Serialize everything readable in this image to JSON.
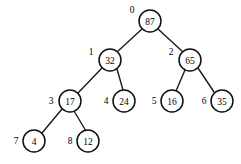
{
  "figure": {
    "type": "binary-tree-diagram",
    "title": "",
    "background_color": "#ffffff",
    "node_fill": "#ffffff",
    "node_stroke": "#111111",
    "edge_color": "#1a1a1a",
    "label_color": "#000000"
  },
  "tree": {
    "node_radius": 11,
    "nodes": [
      {
        "index": "0",
        "value": "87",
        "cx": 150,
        "cy": 21,
        "index_x": 132,
        "index_y": 10
      },
      {
        "index": "1",
        "value": "32",
        "cx": 110,
        "cy": 60,
        "index_x": 91,
        "index_y": 52
      },
      {
        "index": "2",
        "value": "65",
        "cx": 190,
        "cy": 60,
        "index_x": 171,
        "index_y": 52
      },
      {
        "index": "3",
        "value": "17",
        "cx": 70,
        "cy": 101,
        "index_x": 51,
        "index_y": 101
      },
      {
        "index": "4",
        "value": "24",
        "cx": 124,
        "cy": 101,
        "index_x": 106,
        "index_y": 101
      },
      {
        "index": "5",
        "value": "16",
        "cx": 172,
        "cy": 101,
        "index_x": 154,
        "index_y": 101
      },
      {
        "index": "6",
        "value": "35",
        "cx": 222,
        "cy": 101,
        "index_x": 204,
        "index_y": 101
      },
      {
        "index": "7",
        "value": "4",
        "cx": 34,
        "cy": 141,
        "index_x": 16,
        "index_y": 141
      },
      {
        "index": "8",
        "value": "12",
        "cx": 88,
        "cy": 141,
        "index_x": 70,
        "index_y": 141
      }
    ],
    "edges": [
      {
        "from": "0",
        "to": "1",
        "x1": 142,
        "y1": 29,
        "x2": 117,
        "y2": 52
      },
      {
        "from": "0",
        "to": "2",
        "x1": 158,
        "y1": 29,
        "x2": 183,
        "y2": 52
      },
      {
        "from": "1",
        "to": "3",
        "x1": 102,
        "y1": 68,
        "x2": 78,
        "y2": 93
      },
      {
        "from": "1",
        "to": "4",
        "x1": 117,
        "y1": 69,
        "x2": 123,
        "y2": 90
      },
      {
        "from": "2",
        "to": "5",
        "x1": 185,
        "y1": 70,
        "x2": 176,
        "y2": 91
      },
      {
        "from": "2",
        "to": "6",
        "x1": 198,
        "y1": 68,
        "x2": 214,
        "y2": 92
      },
      {
        "from": "3",
        "to": "7",
        "x1": 62,
        "y1": 109,
        "x2": 42,
        "y2": 133
      },
      {
        "from": "3",
        "to": "8",
        "x1": 74,
        "y1": 111,
        "x2": 86,
        "y2": 131
      }
    ]
  }
}
